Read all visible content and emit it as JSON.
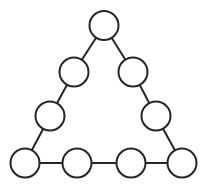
{
  "diagram": {
    "title": "",
    "type": "triangle-node-graph",
    "width": 205,
    "height": 188,
    "colors": {
      "stroke": "#262626",
      "fill": "#ffffff",
      "background": "#ffffff"
    },
    "node_radius": 14.5,
    "stroke_width": 2,
    "nodes": [
      {
        "id": "top",
        "x": 104,
        "y": 25.5,
        "label": ""
      },
      {
        "id": "left-2",
        "x": 74,
        "y": 72,
        "label": ""
      },
      {
        "id": "right-2",
        "x": 133,
        "y": 72,
        "label": ""
      },
      {
        "id": "left-3",
        "x": 50,
        "y": 116,
        "label": ""
      },
      {
        "id": "right-3",
        "x": 156,
        "y": 116,
        "label": ""
      },
      {
        "id": "bottom-1",
        "x": 25,
        "y": 163,
        "label": ""
      },
      {
        "id": "bottom-2",
        "x": 77,
        "y": 163,
        "label": ""
      },
      {
        "id": "bottom-3",
        "x": 131,
        "y": 163,
        "label": ""
      },
      {
        "id": "bottom-4",
        "x": 182,
        "y": 163,
        "label": ""
      }
    ],
    "edges": [
      [
        "top",
        "left-2"
      ],
      [
        "left-2",
        "left-3"
      ],
      [
        "left-3",
        "bottom-1"
      ],
      [
        "top",
        "right-2"
      ],
      [
        "right-2",
        "right-3"
      ],
      [
        "right-3",
        "bottom-4"
      ],
      [
        "bottom-1",
        "bottom-2"
      ],
      [
        "bottom-2",
        "bottom-3"
      ],
      [
        "bottom-3",
        "bottom-4"
      ]
    ]
  }
}
